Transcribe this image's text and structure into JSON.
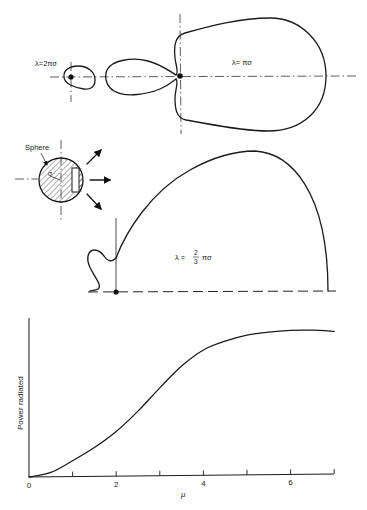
{
  "patterns": {
    "top_small": {
      "label": "λ=2πσ"
    },
    "top_large": {
      "label": "λ= πσ"
    },
    "middle": {
      "label_prefix": "λ =",
      "label_num": "2",
      "label_den": "3",
      "label_suffix": "πσ"
    },
    "sphere": {
      "label": "Sphere",
      "radius_label": "σ"
    }
  },
  "chart_data": {
    "type": "line",
    "title": "",
    "xlabel": "μ",
    "ylabel": "Power radiated",
    "x_ticks": [
      "0",
      "2",
      "4",
      "6"
    ],
    "x_minor_ticks": [
      1,
      3,
      5,
      7
    ],
    "xlim": [
      0,
      7
    ],
    "ylim": [
      0,
      1.05
    ],
    "grid": false,
    "series": [
      {
        "name": "Power radiated",
        "x": [
          0,
          0.5,
          1,
          1.5,
          2,
          2.5,
          3,
          3.5,
          4,
          4.5,
          5,
          5.5,
          6,
          6.5,
          7
        ],
        "values": [
          0,
          0.03,
          0.11,
          0.2,
          0.31,
          0.45,
          0.61,
          0.76,
          0.87,
          0.93,
          0.97,
          0.99,
          1.0,
          1.0,
          0.99
        ]
      }
    ]
  },
  "axis": {
    "tick_labels": [
      "0",
      "2",
      "4",
      "6"
    ],
    "xlabel": "μ",
    "ylabel": "Power radiated"
  }
}
